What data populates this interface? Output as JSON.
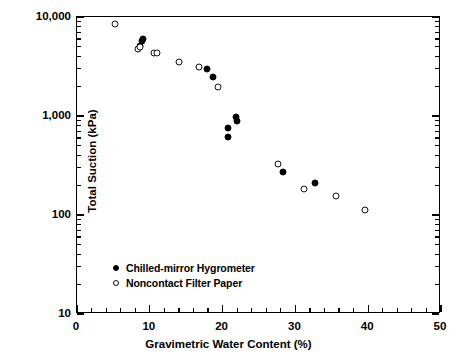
{
  "chart_data": {
    "type": "scatter",
    "title": "",
    "xlabel": "Gravimetric Water Content (%)",
    "ylabel": "Total Suction (kPa)",
    "xlim": [
      0,
      50
    ],
    "ylim": [
      10,
      10000
    ],
    "yscale": "log",
    "xscale": "linear",
    "grid": false,
    "legend_position": "bottom-left",
    "xticks": [
      0,
      10,
      20,
      30,
      40,
      50
    ],
    "xtick_labels": [
      "0",
      "10",
      "20",
      "30",
      "40",
      "50"
    ],
    "xminor_step": 2,
    "yticks": [
      10,
      100,
      1000,
      10000
    ],
    "ytick_labels": [
      "10",
      "100",
      "1,000",
      "10,000"
    ],
    "series": [
      {
        "name": "Chilled-mirror Hygrometer",
        "marker": "filled-circle",
        "color": "#000000",
        "points": [
          {
            "x": 8.6,
            "y": 5100
          },
          {
            "x": 8.9,
            "y": 5750
          },
          {
            "x": 9.1,
            "y": 6050
          },
          {
            "x": 17.9,
            "y": 3000
          },
          {
            "x": 18.7,
            "y": 2500
          },
          {
            "x": 20.7,
            "y": 760
          },
          {
            "x": 20.8,
            "y": 620
          },
          {
            "x": 21.9,
            "y": 980
          },
          {
            "x": 22.0,
            "y": 880
          },
          {
            "x": 28.3,
            "y": 270
          },
          {
            "x": 32.7,
            "y": 210
          }
        ]
      },
      {
        "name": "Noncontact Filter Paper",
        "marker": "open-circle",
        "color": "#000000",
        "points": [
          {
            "x": 5.2,
            "y": 8500
          },
          {
            "x": 8.4,
            "y": 4700
          },
          {
            "x": 8.7,
            "y": 5000
          },
          {
            "x": 10.6,
            "y": 4350
          },
          {
            "x": 11.0,
            "y": 4300
          },
          {
            "x": 14.0,
            "y": 3500
          },
          {
            "x": 16.7,
            "y": 3150
          },
          {
            "x": 19.3,
            "y": 1950
          },
          {
            "x": 27.6,
            "y": 330
          },
          {
            "x": 31.2,
            "y": 185
          },
          {
            "x": 35.6,
            "y": 155
          },
          {
            "x": 39.6,
            "y": 112
          }
        ]
      }
    ]
  },
  "legend": {
    "items": [
      {
        "label": "Chilled-mirror Hygrometer",
        "marker": "filled-circle"
      },
      {
        "label": "Noncontact Filter Paper",
        "marker": "open-circle"
      }
    ]
  }
}
